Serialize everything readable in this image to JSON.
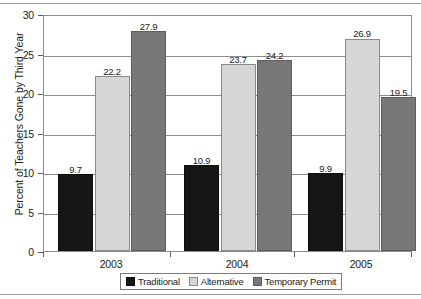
{
  "chart_data": {
    "type": "bar",
    "title": "",
    "xlabel": "",
    "ylabel": "Percent of Teachers Gone by Third Year",
    "ylim": [
      0,
      30
    ],
    "ytick_step": 5,
    "yticks": [
      "0",
      "5",
      "10",
      "15",
      "20",
      "25",
      "30"
    ],
    "grid": true,
    "legend_position": "bottom",
    "categories": [
      "2003",
      "2004",
      "2005"
    ],
    "series": [
      {
        "name": "Traditional",
        "color": "#161616",
        "values": [
          9.7,
          22.2,
          27.9
        ]
      },
      {
        "name": "Alternative",
        "color": "#d6d6d6",
        "values": [
          10.9,
          23.7,
          24.2
        ]
      },
      {
        "name": "Temporary Permit",
        "color": "#787878",
        "values": [
          9.9,
          26.9,
          19.5
        ]
      }
    ],
    "groups": [
      {
        "category": "2003",
        "bars": [
          {
            "series": "Traditional",
            "value": 9.7,
            "label": "9.7"
          },
          {
            "series": "Alternative",
            "value": 22.2,
            "label": "22.2"
          },
          {
            "series": "Temporary Permit",
            "value": 27.9,
            "label": "27.9"
          }
        ]
      },
      {
        "category": "2004",
        "bars": [
          {
            "series": "Traditional",
            "value": 10.9,
            "label": "10.9"
          },
          {
            "series": "Alternative",
            "value": 23.7,
            "label": "23.7"
          },
          {
            "series": "Temporary Permit",
            "value": 24.2,
            "label": "24.2"
          }
        ]
      },
      {
        "category": "2005",
        "bars": [
          {
            "series": "Traditional",
            "value": 9.9,
            "label": "9.9"
          },
          {
            "series": "Alternative",
            "value": 26.9,
            "label": "26.9"
          },
          {
            "series": "Temporary Permit",
            "value": 19.5,
            "label": "19.5"
          }
        ]
      }
    ]
  },
  "legend": {
    "items": [
      {
        "label": "Traditional",
        "swatch": "traditional"
      },
      {
        "label": "Alternative",
        "swatch": "alternative"
      },
      {
        "label": "Temporary Permit",
        "swatch": "temporary"
      }
    ]
  }
}
